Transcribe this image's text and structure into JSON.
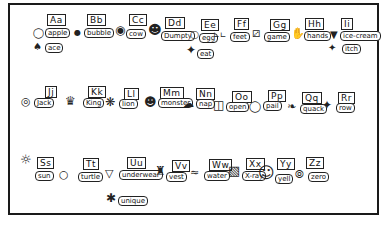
{
  "chart": {
    "rows": [
      {
        "entries": [
          {
            "letter": "Aa",
            "words": [
              "apple",
              "ace"
            ],
            "icons": [
              "apple-icon",
              "ace-card-icon"
            ]
          },
          {
            "letter": "Bb",
            "words": [
              "bubble"
            ],
            "icons": [
              "bubble-icon"
            ]
          },
          {
            "letter": "Cc",
            "words": [
              "cow"
            ],
            "icons": [
              "cow-icon"
            ]
          },
          {
            "letter": "Dd",
            "words": [
              "Dumpty"
            ],
            "icons": [
              "humpty-dumpty-icon"
            ]
          },
          {
            "letter": "Ee",
            "words": [
              "egg",
              "eat"
            ],
            "icons": [
              "egg-icon",
              "eating-icon"
            ]
          },
          {
            "letter": "Ff",
            "words": [
              "feet"
            ],
            "icons": [
              "feet-icon"
            ]
          },
          {
            "letter": "Gg",
            "words": [
              "game"
            ],
            "icons": [
              "game-icon"
            ]
          },
          {
            "letter": "Hh",
            "words": [
              "hands"
            ],
            "icons": [
              "hands-icon"
            ]
          },
          {
            "letter": "Ii",
            "words": [
              "ice-cream",
              "itch"
            ],
            "icons": [
              "ice-cream-icon",
              "itch-icon"
            ]
          }
        ]
      },
      {
        "entries": [
          {
            "letter": "Jj",
            "words": [
              "Jack"
            ],
            "icons": [
              "jack-icon"
            ]
          },
          {
            "letter": "Kk",
            "words": [
              "King"
            ],
            "icons": [
              "crown-icon"
            ]
          },
          {
            "letter": "Ll",
            "words": [
              "lion"
            ],
            "icons": [
              "lion-icon"
            ]
          },
          {
            "letter": "Mm",
            "words": [
              "monster"
            ],
            "icons": [
              "monster-icon"
            ]
          },
          {
            "letter": "Nn",
            "words": [
              "nap"
            ],
            "icons": [
              "nap-icon"
            ]
          },
          {
            "letter": "Oo",
            "words": [
              "open"
            ],
            "icons": [
              "door-icon"
            ]
          },
          {
            "letter": "Pp",
            "words": [
              "pail"
            ],
            "icons": [
              "pail-icon"
            ]
          },
          {
            "letter": "Qq",
            "words": [
              "quack"
            ],
            "icons": [
              "duck-icon"
            ]
          },
          {
            "letter": "Rr",
            "words": [
              "row"
            ],
            "icons": [
              "rowing-icon"
            ]
          }
        ]
      },
      {
        "entries": [
          {
            "letter": "Ss",
            "words": [
              "sun"
            ],
            "icons": [
              "sun-icon"
            ]
          },
          {
            "letter": "Tt",
            "words": [
              "turtle"
            ],
            "icons": [
              "turtle-icon"
            ]
          },
          {
            "letter": "Uu",
            "words": [
              "underwear",
              "unique"
            ],
            "icons": [
              "underwear-icon",
              "unique-icon"
            ]
          },
          {
            "letter": "Vv",
            "words": [
              "vest"
            ],
            "icons": [
              "vest-icon"
            ]
          },
          {
            "letter": "Ww",
            "words": [
              "water"
            ],
            "icons": [
              "water-icon"
            ]
          },
          {
            "letter": "Xx",
            "words": [
              "X-ray"
            ],
            "icons": [
              "x-ray-icon"
            ]
          },
          {
            "letter": "Yy",
            "words": [
              "yell"
            ],
            "icons": [
              "yell-icon"
            ]
          },
          {
            "letter": "Zz",
            "words": [
              "zero"
            ],
            "icons": [
              "zero-icon"
            ]
          }
        ]
      }
    ]
  }
}
